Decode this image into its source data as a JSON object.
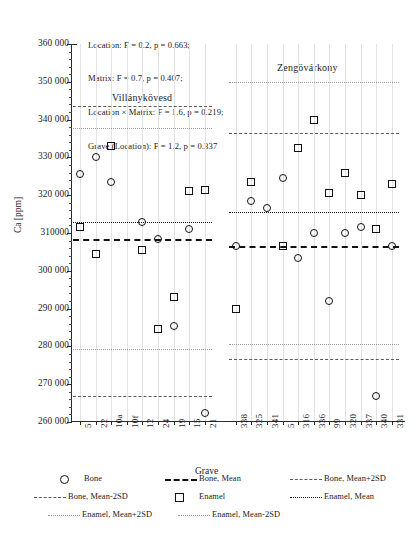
{
  "chart_data": {
    "type": "scatter",
    "title": "",
    "xlabel": "Grave",
    "ylabel": "Ca [ppm]",
    "ylim": [
      260000,
      360000
    ],
    "ytick_labels": [
      "360 000",
      "350 000",
      "340 000",
      "330 000",
      "320 000",
      "310000",
      "300 000",
      "290 000",
      "280 000",
      "270 000",
      "260 000"
    ],
    "ytick_values": [
      360000,
      350000,
      340000,
      330000,
      320000,
      310000,
      300000,
      290000,
      280000,
      270000,
      260000
    ],
    "grid": "vertical-faint",
    "legend_position": "below-plot",
    "annotations": [
      "Location: F = 0.2, p = 0.663;",
      "Matrix: F = 0.7, p = 0.407;",
      "Location × Matrix: F = 1.6, p = 0.219;",
      "Grave (Location): F = 1.2, p = 0.337"
    ],
    "groups": [
      {
        "name": "Villánykövesd",
        "categories": [
          "5",
          "22",
          "10a",
          "10f",
          "12",
          "24",
          "19",
          "15",
          "21"
        ],
        "series": [
          {
            "name": "Bone",
            "values": [
              325500,
              330000,
              323500,
              null,
              313000,
              308500,
              285500,
              311000,
              262500
            ]
          },
          {
            "name": "Enamel",
            "values": [
              311500,
              304500,
              333000,
              null,
              305500,
              284500,
              293000,
              321000,
              321500
            ]
          }
        ],
        "reference_lines": {
          "bone_mean": 308500,
          "bone_mean_plus_2sd": 343500,
          "bone_mean_minus_2sd": 266900,
          "enamel_mean": 313000,
          "enamel_mean_plus_2sd": 337700,
          "enamel_mean_minus_2sd": 279300
        }
      },
      {
        "name": "Zengövárkony",
        "categories": [
          "338",
          "325",
          "341",
          "5",
          "316",
          "336",
          "99",
          "320",
          "337",
          "340",
          "331"
        ],
        "series": [
          {
            "name": "Bone",
            "values": [
              306500,
              318500,
              316500,
              324500,
              303500,
              310000,
              292000,
              310000,
              311500,
              267000,
              306500
            ]
          },
          {
            "name": "Enamel",
            "values": [
              290000,
              323500,
              null,
              306500,
              332500,
              340000,
              320500,
              326000,
              320000,
              311000,
              323000
            ]
          }
        ],
        "reference_lines": {
          "bone_mean": 306500,
          "bone_mean_plus_2sd": 336500,
          "bone_mean_minus_2sd": 276700,
          "enamel_mean": 315500,
          "enamel_mean_plus_2sd": 350000,
          "enamel_mean_minus_2sd": 280700
        }
      }
    ],
    "legend": [
      {
        "label": "Bone",
        "symbol": "open-circle"
      },
      {
        "label": "Bone, Mean",
        "symbol": "thick-dashed-line"
      },
      {
        "label": "Bone, Mean+2SD",
        "symbol": "dashed-line"
      },
      {
        "label": "Bone, Mean-2SD",
        "symbol": "dashed-line"
      },
      {
        "label": "Enamel",
        "symbol": "open-square"
      },
      {
        "label": "Enamel, Mean",
        "symbol": "dotted-line"
      },
      {
        "label": "Enamel, Mean+2SD",
        "symbol": "fine-dotted-line"
      },
      {
        "label": "Enamel, Mean-2SD",
        "symbol": "fine-dotted-line"
      }
    ]
  }
}
